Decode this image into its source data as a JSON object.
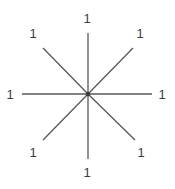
{
  "diagram": {
    "type": "star-rays",
    "background_color": "#ffffff",
    "line_color": "#58585a",
    "line_width": 1.3,
    "label_color": "#3a3a3c",
    "center": {
      "x": 88,
      "y": 94
    },
    "center_dot_radius": 2.2,
    "rays": [
      {
        "direction": "up",
        "x2": 88,
        "y2": 33,
        "label": "1",
        "label_x": 87,
        "label_y": 18
      },
      {
        "direction": "up-right",
        "x2": 133,
        "y2": 48,
        "label": "1",
        "label_x": 140,
        "label_y": 33
      },
      {
        "direction": "right",
        "x2": 152,
        "y2": 94,
        "label": "1",
        "label_x": 162,
        "label_y": 94
      },
      {
        "direction": "down-right",
        "x2": 135,
        "y2": 140,
        "label": "1",
        "label_x": 141,
        "label_y": 152
      },
      {
        "direction": "down",
        "x2": 88,
        "y2": 159,
        "label": "1",
        "label_x": 87,
        "label_y": 172
      },
      {
        "direction": "down-left",
        "x2": 43,
        "y2": 140,
        "label": "1",
        "label_x": 33,
        "label_y": 152
      },
      {
        "direction": "left",
        "x2": 22,
        "y2": 94,
        "label": "1",
        "label_x": 10,
        "label_y": 94
      },
      {
        "direction": "up-left",
        "x2": 43,
        "y2": 48,
        "label": "1",
        "label_x": 33,
        "label_y": 33
      }
    ]
  }
}
